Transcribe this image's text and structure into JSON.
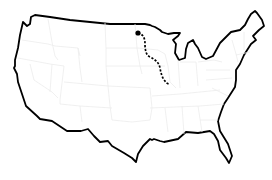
{
  "map": {
    "subject": "United States outline map",
    "colors": {
      "background": "#ffffff",
      "outline": "#000000",
      "state_borders": "#ececec",
      "route": "#000000",
      "marker": "#000000"
    },
    "route": {
      "style": "dashed",
      "start_marker": {
        "shape": "dot",
        "x": 138,
        "y": 33,
        "approx_region": "North Dakota / Minnesota border"
      },
      "end": {
        "x": 169,
        "y": 84,
        "approx_region": "Missouri / Illinois"
      },
      "points": [
        [
          138,
          33
        ],
        [
          143,
          36
        ],
        [
          145,
          42
        ],
        [
          145,
          50
        ],
        [
          148,
          56
        ],
        [
          154,
          59
        ],
        [
          158,
          62
        ],
        [
          160,
          68
        ],
        [
          162,
          74
        ],
        [
          165,
          80
        ],
        [
          169,
          84
        ]
      ]
    }
  }
}
